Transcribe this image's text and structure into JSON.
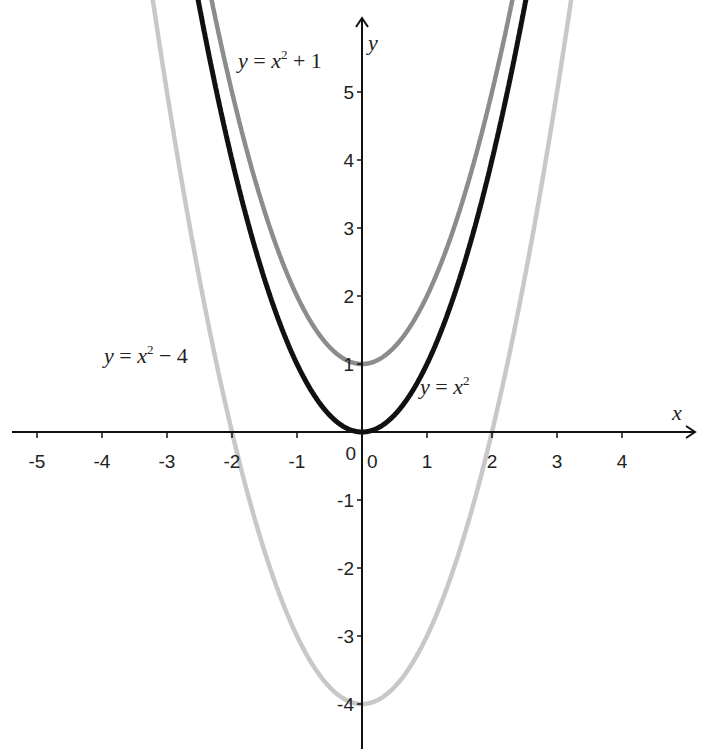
{
  "chart_data": {
    "type": "line",
    "title": "",
    "xlabel": "x",
    "ylabel": "y",
    "xlim": [
      -5.5,
      5.2
    ],
    "ylim": [
      -4.6,
      6.3
    ],
    "grid": false,
    "x_ticks": [
      -5,
      -4,
      -3,
      -2,
      -1,
      0,
      1,
      2,
      3,
      4
    ],
    "y_ticks": [
      -4,
      -3,
      -2,
      -1,
      0,
      1,
      2,
      3,
      4,
      5
    ],
    "x_tick_labels": [
      "-5",
      "-4",
      "-3",
      "-2",
      "-1",
      "0",
      "1",
      "2",
      "3",
      "4"
    ],
    "y_tick_labels": [
      "-4",
      "-3",
      "-2",
      "-1",
      "0",
      "1",
      "2",
      "3",
      "4",
      "5"
    ],
    "series": [
      {
        "name": "y = x² + 1",
        "function": "x^2+1",
        "color": "#8c8c8c",
        "label": {
          "prefix": "y = x",
          "sup": "2",
          "suffix": " + 1"
        }
      },
      {
        "name": "y = x²",
        "function": "x^2",
        "color": "#111111",
        "label": {
          "prefix": "y = x",
          "sup": "2",
          "suffix": ""
        }
      },
      {
        "name": "y = x² − 4",
        "function": "x^2-4",
        "color": "#c8c8c8",
        "label": {
          "prefix": "y = x",
          "sup": "2",
          "suffix": " − 4"
        }
      }
    ]
  }
}
